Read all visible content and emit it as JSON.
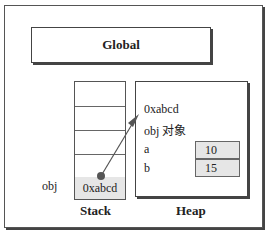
{
  "global": {
    "label": "Global"
  },
  "stack": {
    "label": "Stack",
    "rows": [
      "",
      "",
      "",
      "",
      "0xabcd"
    ],
    "variable_label": "obj"
  },
  "heap": {
    "label": "Heap",
    "address": "0xabcd",
    "object_label": "obj 对象",
    "properties": [
      {
        "name": "a",
        "value": "10"
      },
      {
        "name": "b",
        "value": "15"
      }
    ]
  },
  "arrow": {
    "from": "stack.rows.4",
    "to": "heap.address",
    "color": "#555555"
  }
}
